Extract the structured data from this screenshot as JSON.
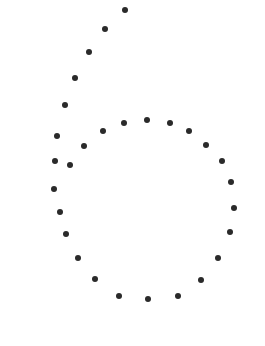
{
  "figure": {
    "dot_color": "#2a2a2a",
    "background": "#ffffff",
    "dots": [
      {
        "x": 125,
        "y": 10
      },
      {
        "x": 105,
        "y": 29
      },
      {
        "x": 89,
        "y": 52
      },
      {
        "x": 75,
        "y": 78
      },
      {
        "x": 65,
        "y": 105
      },
      {
        "x": 57,
        "y": 136
      },
      {
        "x": 55,
        "y": 161
      },
      {
        "x": 54,
        "y": 189
      },
      {
        "x": 60,
        "y": 212
      },
      {
        "x": 66,
        "y": 234
      },
      {
        "x": 78,
        "y": 258
      },
      {
        "x": 95,
        "y": 279
      },
      {
        "x": 119,
        "y": 296
      },
      {
        "x": 148,
        "y": 299
      },
      {
        "x": 178,
        "y": 296
      },
      {
        "x": 201,
        "y": 280
      },
      {
        "x": 218,
        "y": 258
      },
      {
        "x": 230,
        "y": 232
      },
      {
        "x": 234,
        "y": 208
      },
      {
        "x": 231,
        "y": 182
      },
      {
        "x": 222,
        "y": 161
      },
      {
        "x": 206,
        "y": 145
      },
      {
        "x": 189,
        "y": 131
      },
      {
        "x": 170,
        "y": 123
      },
      {
        "x": 147,
        "y": 120
      },
      {
        "x": 124,
        "y": 123
      },
      {
        "x": 103,
        "y": 131
      },
      {
        "x": 84,
        "y": 146
      },
      {
        "x": 70,
        "y": 165
      }
    ]
  }
}
